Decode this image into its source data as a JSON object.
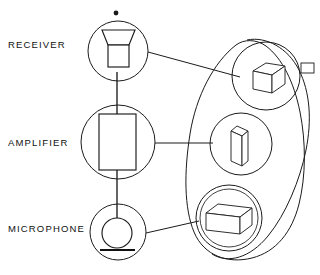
{
  "diagram": {
    "background_color": "#ffffff",
    "line_color": "#1b1b1b",
    "labels": [
      {
        "id": "receiver",
        "text": "RECEIVER",
        "x": 8,
        "y": 48
      },
      {
        "id": "amplifier",
        "text": "AMPLIFIER",
        "x": 8,
        "y": 146
      },
      {
        "id": "microphone",
        "text": "MICROPHONE",
        "x": 8,
        "y": 232
      }
    ],
    "left_column": {
      "receiver": {
        "label": "RECEIVER",
        "symbol": "speaker-horn",
        "circle": {
          "cx": 118,
          "cy": 51,
          "r": 30
        },
        "knob": {
          "cx": 116,
          "cy": 13,
          "r": 2.6
        }
      },
      "amplifier": {
        "label": "AMPLIFIER",
        "symbol": "rectangle-block",
        "circle": {
          "cx": 118,
          "cy": 142,
          "r": 37
        },
        "block": {
          "x": 99,
          "y": 114,
          "w": 36,
          "h": 56
        }
      },
      "microphone": {
        "label": "MICROPHONE",
        "symbol": "microphone-circle-base",
        "circle": {
          "cx": 118,
          "cy": 232,
          "r": 28
        },
        "inner_circle": {
          "cx": 117,
          "cy": 233,
          "r": 15
        },
        "base_line": {
          "x1": 100,
          "y1": 250,
          "x2": 134,
          "y2": 250
        }
      }
    },
    "right_column": {
      "enclosure_label": "component-group-outline",
      "items": [
        {
          "id": "cube-component",
          "shape": "isometric-cube",
          "circle": {
            "cx": 266,
            "cy": 76,
            "r": 34
          },
          "tab": {
            "x": 301,
            "y": 63,
            "w": 13,
            "h": 10
          }
        },
        {
          "id": "plate-component",
          "shape": "thin-slab-panel",
          "circle": {
            "cx": 241,
            "cy": 144,
            "r": 31
          }
        },
        {
          "id": "box-component",
          "shape": "rectangular-box",
          "circle": {
            "cx": 229,
            "cy": 218,
            "r": 33
          }
        }
      ]
    },
    "connectors": [
      {
        "id": "receiver-to-cube",
        "from": "receiver",
        "to": "cube-component",
        "x1": 148,
        "y1": 52,
        "x2": 238,
        "y2": 76
      },
      {
        "id": "amplifier-to-plate",
        "from": "amplifier",
        "to": "plate-component",
        "x1": 155,
        "y1": 143,
        "x2": 212,
        "y2": 143
      },
      {
        "id": "microphone-to-box",
        "from": "microphone",
        "to": "box-component",
        "x1": 146,
        "y1": 233,
        "x2": 198,
        "y2": 221
      },
      {
        "id": "receiver-to-amplifier",
        "from": "receiver",
        "to": "amplifier",
        "x1": 117,
        "y1": 81,
        "x2": 117,
        "y2": 114
      },
      {
        "id": "amplifier-to-microphone",
        "from": "amplifier",
        "to": "microphone",
        "x1": 117,
        "y1": 170,
        "x2": 117,
        "y2": 233
      }
    ]
  }
}
